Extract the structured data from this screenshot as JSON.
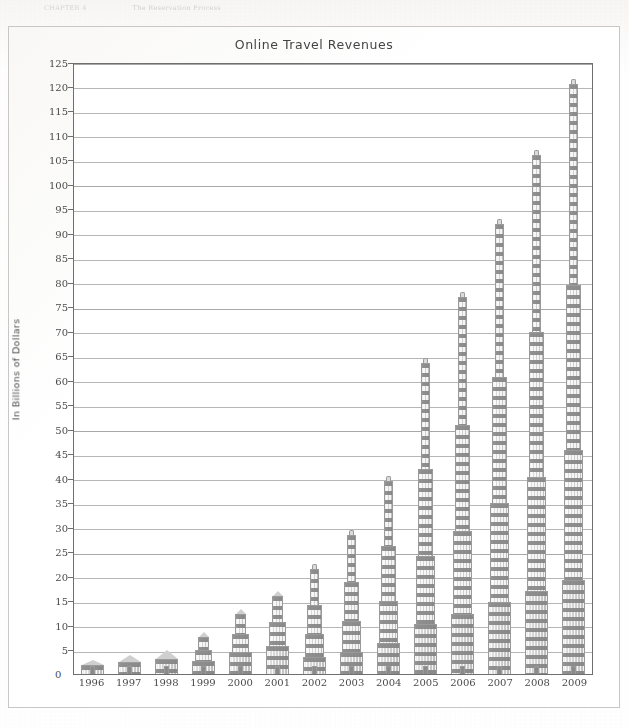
{
  "page": {
    "running_header_left": "CHAPTER 4",
    "running_header_right": "The Reservation Process"
  },
  "figure": {
    "title": "Online Travel Revenues"
  },
  "chart_data": {
    "type": "bar",
    "title": "Online Travel Revenues",
    "xlabel": "",
    "ylabel": "In Billions of Dollars",
    "categories": [
      "1996",
      "1997",
      "1998",
      "1999",
      "2000",
      "2001",
      "2002",
      "2003",
      "2004",
      "2005",
      "2006",
      "2007",
      "2008",
      "2009"
    ],
    "values": [
      3,
      3.8,
      5,
      8.5,
      13.3,
      17,
      22.5,
      29.5,
      40.5,
      64.5,
      78,
      93,
      107,
      121.5
    ],
    "ylim": [
      0,
      125
    ],
    "ytick_step": 5,
    "yticks": [
      0,
      5,
      10,
      15,
      20,
      25,
      30,
      35,
      40,
      45,
      50,
      55,
      60,
      65,
      70,
      75,
      80,
      85,
      90,
      95,
      100,
      105,
      110,
      115,
      120,
      125
    ],
    "ytick_labels": [
      "0",
      "5",
      "10",
      "15",
      "20",
      "25",
      "30",
      "35",
      "40",
      "45",
      "50",
      "55",
      "60",
      "65",
      "70",
      "75",
      "80",
      "85",
      "90",
      "95",
      "100",
      "105",
      "110",
      "115",
      "120",
      "125"
    ],
    "grid": true,
    "legend": null,
    "bar_style": "stylized-building",
    "colors": {
      "bar_fill": "#d3d3d3",
      "bar_stroke": "#9a9a9a",
      "window": "#787878",
      "gridline": "#b6b6b6",
      "axis": "#6f6f6f",
      "text": "#4a4a4a"
    }
  }
}
